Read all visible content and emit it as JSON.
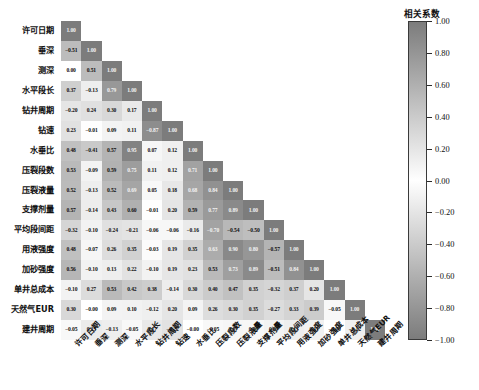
{
  "chart_data": {
    "type": "heatmap",
    "title": "",
    "subtype": "lower-triangular correlation matrix",
    "colorbar": {
      "label": "相关系数",
      "ticks": [
        "1.00",
        "0.80",
        "0.60",
        "0.40",
        "0.20",
        "0.00",
        "-0.20",
        "-0.40",
        "-0.60",
        "-0.80",
        "-1.00"
      ],
      "tick_values": [
        1.0,
        0.8,
        0.6,
        0.4,
        0.2,
        0.0,
        -0.2,
        -0.4,
        -0.6,
        -0.8,
        -1.0
      ],
      "vmin": -1.0,
      "vmax": 1.0,
      "colormap": "diverging-gray (dark at both ends, white at 0)",
      "position": "right"
    },
    "categories": [
      "许可日期",
      "垂深",
      "测深",
      "水平段长",
      "钻井周期",
      "钻速",
      "水垂比",
      "压裂段数",
      "压裂液量",
      "支撑剂量",
      "平均段间距",
      "用液强度",
      "加砂强度",
      "单井总成本",
      "天然气EUR",
      "建井周期"
    ],
    "xlabel": "",
    "ylabel": "",
    "grid": false,
    "matrix": [
      [
        1.0,
        null,
        null,
        null,
        null,
        null,
        null,
        null,
        null,
        null,
        null,
        null,
        null,
        null,
        null,
        null
      ],
      [
        -0.51,
        1.0,
        null,
        null,
        null,
        null,
        null,
        null,
        null,
        null,
        null,
        null,
        null,
        null,
        null,
        null
      ],
      [
        0.0,
        0.51,
        1.0,
        null,
        null,
        null,
        null,
        null,
        null,
        null,
        null,
        null,
        null,
        null,
        null,
        null
      ],
      [
        0.37,
        -0.13,
        0.79,
        1.0,
        null,
        null,
        null,
        null,
        null,
        null,
        null,
        null,
        null,
        null,
        null,
        null
      ],
      [
        -0.2,
        0.24,
        0.3,
        0.17,
        1.0,
        null,
        null,
        null,
        null,
        null,
        null,
        null,
        null,
        null,
        null,
        null
      ],
      [
        0.23,
        -0.01,
        0.09,
        0.11,
        -0.87,
        1.0,
        null,
        null,
        null,
        null,
        null,
        null,
        null,
        null,
        null,
        null
      ],
      [
        0.48,
        -0.41,
        0.57,
        0.95,
        0.07,
        0.12,
        1.0,
        null,
        null,
        null,
        null,
        null,
        null,
        null,
        null,
        null
      ],
      [
        0.53,
        -0.09,
        0.59,
        0.75,
        0.11,
        0.12,
        0.71,
        1.0,
        null,
        null,
        null,
        null,
        null,
        null,
        null,
        null
      ],
      [
        0.52,
        -0.13,
        0.52,
        0.69,
        0.05,
        0.18,
        0.68,
        0.84,
        1.0,
        null,
        null,
        null,
        null,
        null,
        null,
        null
      ],
      [
        0.57,
        -0.14,
        0.43,
        0.6,
        -0.01,
        0.2,
        0.59,
        0.77,
        0.89,
        1.0,
        null,
        null,
        null,
        null,
        null,
        null
      ],
      [
        -0.32,
        -0.1,
        -0.24,
        -0.21,
        -0.06,
        -0.06,
        -0.16,
        -0.7,
        -0.54,
        -0.5,
        1.0,
        null,
        null,
        null,
        null,
        null
      ],
      [
        0.48,
        -0.07,
        0.26,
        0.35,
        -0.03,
        0.19,
        0.35,
        0.63,
        0.9,
        0.8,
        -0.57,
        1.0,
        null,
        null,
        null,
        null
      ],
      [
        0.56,
        -0.1,
        0.13,
        0.22,
        -0.1,
        0.19,
        0.23,
        0.53,
        0.73,
        0.89,
        -0.51,
        0.84,
        1.0,
        null,
        null,
        null
      ],
      [
        -0.1,
        0.27,
        0.53,
        0.42,
        0.38,
        -0.14,
        0.3,
        0.4,
        0.47,
        0.35,
        -0.32,
        0.37,
        0.2,
        1.0,
        null,
        null
      ],
      [
        0.3,
        -0.0,
        0.09,
        0.1,
        -0.12,
        0.2,
        0.09,
        0.26,
        0.3,
        0.35,
        -0.27,
        0.33,
        0.39,
        -0.05,
        1.0,
        null
      ],
      [
        -0.05,
        0.15,
        -0.13,
        -0.05,
        0.17,
        -0.22,
        -0.0,
        -0.05,
        0.07,
        0.06,
        0.09,
        0.13,
        0.11,
        -0.0,
        -0.12,
        1.0
      ]
    ],
    "cell_labels": [
      [
        "1.00"
      ],
      [
        "-0.51",
        "1.00"
      ],
      [
        "0.00",
        "0.51",
        "1.00"
      ],
      [
        "0.37",
        "-0.13",
        "0.79",
        "1.00"
      ],
      [
        "-0.20",
        "0.24",
        "0.30",
        "0.17",
        "1.00"
      ],
      [
        "0.23",
        "-0.01",
        "0.09",
        "0.11",
        "-0.87",
        "1.00"
      ],
      [
        "0.48",
        "-0.41",
        "0.57",
        "0.95",
        "0.07",
        "0.12",
        "1.00"
      ],
      [
        "0.53",
        "-0.09",
        "0.59",
        "0.75",
        "0.11",
        "0.12",
        "0.71",
        "1.00"
      ],
      [
        "0.52",
        "-0.13",
        "0.52",
        "0.69",
        "0.05",
        "0.18",
        "0.68",
        "0.84",
        "1.00"
      ],
      [
        "0.57",
        "-0.14",
        "0.43",
        "0.60",
        "-0.01",
        "0.20",
        "0.59",
        "0.77",
        "0.89",
        "1.00"
      ],
      [
        "-0.32",
        "-0.10",
        "-0.24",
        "-0.21",
        "-0.06",
        "-0.06",
        "-0.16",
        "-0.70",
        "-0.54",
        "-0.50",
        "1.00"
      ],
      [
        "0.48",
        "-0.07",
        "0.26",
        "0.35",
        "-0.03",
        "0.19",
        "0.35",
        "0.63",
        "0.90",
        "0.80",
        "-0.57",
        "1.00"
      ],
      [
        "0.56",
        "-0.10",
        "0.13",
        "0.22",
        "-0.10",
        "0.19",
        "0.23",
        "0.53",
        "0.73",
        "0.89",
        "-0.51",
        "0.84",
        "1.00"
      ],
      [
        "-0.10",
        "0.27",
        "0.53",
        "0.42",
        "0.38",
        "-0.14",
        "0.30",
        "0.40",
        "0.47",
        "0.35",
        "-0.32",
        "0.37",
        "0.20",
        "1.00"
      ],
      [
        "0.30",
        "-0.00",
        "0.09",
        "0.10",
        "-0.12",
        "0.20",
        "0.09",
        "0.26",
        "0.30",
        "0.35",
        "-0.27",
        "0.33",
        "0.39",
        "-0.05",
        "1.00"
      ],
      [
        "-0.05",
        "0.15",
        "-0.13",
        "-0.05",
        "0.17",
        "-0.22",
        "-0.00",
        "-0.05",
        "0.07",
        "0.06",
        "0.09",
        "0.13",
        "0.11",
        "-0.00",
        "-0.12",
        "1.00"
      ]
    ]
  }
}
